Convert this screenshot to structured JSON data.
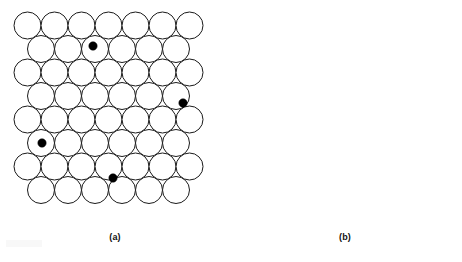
{
  "figure": {
    "type": "crystal-lattice-defect-diagram",
    "background_color": "#ffffff",
    "width": 462,
    "height": 262,
    "atom_outline_color": "#1a1a1a",
    "atom_fill_color": "#ffffff",
    "defect_fill_color": "#000000",
    "atom_stroke_width": 1.0,
    "lattice_radius": 13.5,
    "interstitial_radius": 4.0
  },
  "panels": [
    {
      "id": "panel-a",
      "caption": "(a)",
      "defect_type": "interstitial",
      "caption_x": 115,
      "caption_y": 232,
      "origin_x": 14,
      "origin_y": 12,
      "rows": 9,
      "cols": 7,
      "row_offsets": [
        0,
        1,
        0,
        1,
        0,
        1,
        0,
        1,
        0
      ],
      "defects": [
        {
          "cx": 93,
          "cy": 46,
          "r": 4.2
        },
        {
          "cx": 183,
          "cy": 103,
          "r": 4.2
        },
        {
          "cx": 42,
          "cy": 143,
          "r": 4.2
        },
        {
          "cx": 113,
          "cy": 178,
          "r": 4.2
        }
      ]
    },
    {
      "id": "panel-b",
      "caption": "(b)",
      "defect_type": "substitutional",
      "caption_x": 345,
      "caption_y": 232,
      "origin_x": 260,
      "origin_y": 12,
      "rows": 9,
      "cols": 7,
      "row_offsets": [
        0,
        1,
        0,
        1,
        0,
        1,
        0,
        1,
        0
      ],
      "defects": [
        {
          "cx": 313,
          "cy": 86,
          "r": 13.5
        },
        {
          "cx": 400,
          "cy": 67,
          "r": 13.5
        },
        {
          "cx": 288,
          "cy": 197,
          "r": 13.5
        },
        {
          "cx": 422,
          "cy": 160,
          "r": 13.5
        }
      ]
    }
  ],
  "chart_data": {
    "type": "diagram",
    "title": "",
    "panel_labels": [
      "(a)",
      "(b)"
    ],
    "lattice": {
      "packing": "close-packed-hexagonal",
      "atom_diameter_px": 27,
      "row_spacing_px": 23.5,
      "column_spacing_px": 27,
      "row_offset_px": 13.5,
      "rows_per_panel": 9,
      "columns_per_panel": 7
    },
    "series": [
      {
        "name": "(a) interstitial defects",
        "defect_type": "interstitial",
        "defect_count": 4,
        "defect_diameter_px": 8,
        "values": [
          {
            "x": 93,
            "y": 46
          },
          {
            "x": 183,
            "y": 103
          },
          {
            "x": 42,
            "y": 143
          },
          {
            "x": 113,
            "y": 178
          }
        ]
      },
      {
        "name": "(b) substitutional defects",
        "defect_type": "substitutional",
        "defect_count": 4,
        "defect_diameter_px": 27,
        "values": [
          {
            "x": 313,
            "y": 86
          },
          {
            "x": 400,
            "y": 67
          },
          {
            "x": 288,
            "y": 197
          },
          {
            "x": 422,
            "y": 160
          }
        ]
      }
    ]
  }
}
